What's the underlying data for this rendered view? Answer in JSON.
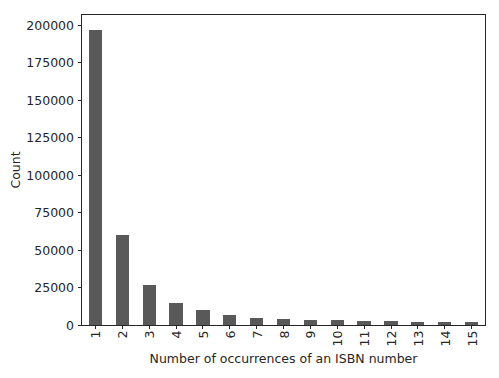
{
  "chart_data": {
    "type": "bar",
    "title": "",
    "xlabel": "Number of occurrences of an ISBN number",
    "ylabel": "Count",
    "categories": [
      "1",
      "2",
      "3",
      "4",
      "5",
      "6",
      "7",
      "8",
      "9",
      "10",
      "11",
      "12",
      "13",
      "14",
      "15"
    ],
    "values": [
      197000,
      60000,
      26500,
      14500,
      9900,
      7000,
      5000,
      3900,
      3600,
      3400,
      2900,
      2600,
      2200,
      2000,
      1800
    ],
    "ylim": [
      0,
      207000
    ],
    "yticks": [
      {
        "value": 0,
        "label": "0"
      },
      {
        "value": 25000,
        "label": "25000"
      },
      {
        "value": 50000,
        "label": "50000"
      },
      {
        "value": 75000,
        "label": "75000"
      },
      {
        "value": 100000,
        "label": "100000"
      },
      {
        "value": 125000,
        "label": "125000"
      },
      {
        "value": 150000,
        "label": "150000"
      },
      {
        "value": 175000,
        "label": "175000"
      },
      {
        "value": 200000,
        "label": "200000"
      }
    ],
    "xtick_rotation": 90,
    "grid": false,
    "legend": null,
    "bar_color": "#595959",
    "axis_color": "#262626",
    "text_color": "#262626",
    "background_color": "#ffffff"
  }
}
